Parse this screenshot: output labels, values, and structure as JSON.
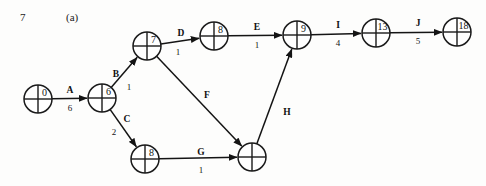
{
  "header": {
    "number": "7",
    "label": "(a)"
  },
  "colors": {
    "ink": "#141414",
    "page_background": "#fdfdfc",
    "node_fill": "#ffffff"
  },
  "chart_data": {
    "type": "diagram",
    "diagram_kind": "activity-on-arrow network / CPM project network",
    "title": "",
    "node_radius": 14,
    "nodes": [
      {
        "id": "n0",
        "label": "0",
        "cx": 38,
        "cy": 99,
        "divided": true
      },
      {
        "id": "n6",
        "label": "6",
        "cx": 102,
        "cy": 98,
        "divided": true
      },
      {
        "id": "n7",
        "label": "7",
        "cx": 147,
        "cy": 46,
        "divided": true
      },
      {
        "id": "n8t",
        "label": "8",
        "cx": 214,
        "cy": 36,
        "divided": true
      },
      {
        "id": "n9",
        "label": "9",
        "cx": 297,
        "cy": 35,
        "divided": true
      },
      {
        "id": "n13",
        "label": "13",
        "cx": 376,
        "cy": 33,
        "divided": true
      },
      {
        "id": "n18",
        "label": "18",
        "cx": 457,
        "cy": 32,
        "divided": true
      },
      {
        "id": "n8b",
        "label": "8",
        "cx": 145,
        "cy": 159,
        "divided": true
      },
      {
        "id": "nx",
        "label": "",
        "cx": 252,
        "cy": 157,
        "divided": true
      }
    ],
    "edges": [
      {
        "id": "A",
        "label": "A",
        "weight": "6",
        "from": "n0",
        "to": "n6",
        "label_x": 70,
        "label_y": 90,
        "weight_x": 70,
        "weight_y": 108,
        "arrow": true
      },
      {
        "id": "B",
        "label": "B",
        "weight": "1",
        "from": "n6",
        "to": "n7",
        "label_x": 116,
        "label_y": 74,
        "weight_x": 129,
        "weight_y": 87,
        "arrow": true
      },
      {
        "id": "C",
        "label": "C",
        "weight": "2",
        "from": "n6",
        "to": "n8b",
        "label_x": 127,
        "label_y": 119,
        "weight_x": 114,
        "weight_y": 132,
        "arrow": true
      },
      {
        "id": "D",
        "label": "D",
        "weight": "1",
        "from": "n7",
        "to": "n8t",
        "label_x": 181,
        "label_y": 33,
        "weight_x": 178,
        "weight_y": 52,
        "arrow": true
      },
      {
        "id": "E",
        "label": "E",
        "weight": "1",
        "from": "n8t",
        "to": "n9",
        "label_x": 257,
        "label_y": 27,
        "weight_x": 257,
        "weight_y": 45,
        "arrow": true
      },
      {
        "id": "F",
        "label": "F",
        "weight": "",
        "from": "n7",
        "to": "nx",
        "label_x": 207,
        "label_y": 95,
        "weight_x": 0,
        "weight_y": 0,
        "arrow": true
      },
      {
        "id": "G",
        "label": "G",
        "weight": "1",
        "from": "n8b",
        "to": "nx",
        "label_x": 201,
        "label_y": 152,
        "weight_x": 201,
        "weight_y": 170,
        "arrow": true
      },
      {
        "id": "H",
        "label": "H",
        "weight": "",
        "from": "nx",
        "to": "n9",
        "label_x": 287,
        "label_y": 112,
        "weight_x": 0,
        "weight_y": 0,
        "arrow": true
      },
      {
        "id": "I",
        "label": "I",
        "weight": "4",
        "from": "n9",
        "to": "n13",
        "label_x": 338,
        "label_y": 25,
        "weight_x": 338,
        "weight_y": 43,
        "arrow": true
      },
      {
        "id": "J",
        "label": "J",
        "weight": "5",
        "from": "n13",
        "to": "n18",
        "label_x": 418,
        "label_y": 23,
        "weight_x": 418,
        "weight_y": 41,
        "arrow": true
      }
    ]
  }
}
